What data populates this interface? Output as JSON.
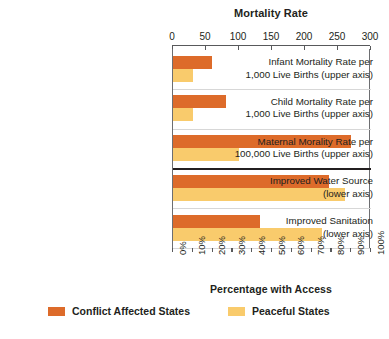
{
  "chart_data": {
    "type": "bar",
    "orientation": "horizontal",
    "title": "Mortality Rate",
    "xlabel_top": "Mortality Rate",
    "xlabel_bottom": "Percentage with Access",
    "top_axis": {
      "label": "Mortality Rate",
      "ticks": [
        0,
        50,
        100,
        150,
        200,
        250,
        300
      ],
      "ticklabels": [
        "0",
        "50",
        "100",
        "150",
        "200",
        "250",
        "300"
      ],
      "range": [
        0,
        300
      ]
    },
    "bottom_axis": {
      "label": "Percentage with Access",
      "ticks": [
        0,
        10,
        20,
        30,
        40,
        50,
        60,
        70,
        80,
        90,
        100
      ],
      "ticklabels": [
        "0%",
        "10%",
        "20%",
        "30%",
        "40%",
        "50%",
        "60%",
        "70%",
        "80%",
        "90%",
        "100%"
      ],
      "range": [
        0,
        100
      ]
    },
    "grid": false,
    "legend_position": "bottom",
    "series": [
      {
        "name": "Conflict Affected States",
        "color": "#dd6b2a",
        "values": [
          59,
          80,
          270,
          79,
          44
        ]
      },
      {
        "name": "Peaceful States",
        "color": "#f9cb6c",
        "values": [
          30,
          30,
          100,
          87,
          75
        ]
      }
    ],
    "categories": [
      {
        "lines": [
          "Infant Mortality Rate per",
          "1,000 Live Births (upper axis)"
        ],
        "axis": "top"
      },
      {
        "lines": [
          "Child Mortality Rate per",
          "1,000 Live Births (upper axis)"
        ],
        "axis": "top"
      },
      {
        "lines": [
          "Maternal Morality Rate per",
          "100,000 Live Births (upper axis)"
        ],
        "axis": "top"
      },
      {
        "lines": [
          "Improved Water Source",
          "(lower axis)"
        ],
        "axis": "bottom"
      },
      {
        "lines": [
          "Improved Sanitation",
          "(lower axis)"
        ],
        "axis": "bottom"
      }
    ]
  },
  "legend": {
    "items": [
      {
        "label": "Conflict Affected States",
        "color": "#dd6b2a"
      },
      {
        "label": "Peaceful States",
        "color": "#f9cb6c"
      }
    ]
  },
  "colors": {
    "conflict": "#dd6b2a",
    "peaceful": "#f9cb6c",
    "axis": "#58595b",
    "divider": "#231f20",
    "background": "#ffffff"
  }
}
